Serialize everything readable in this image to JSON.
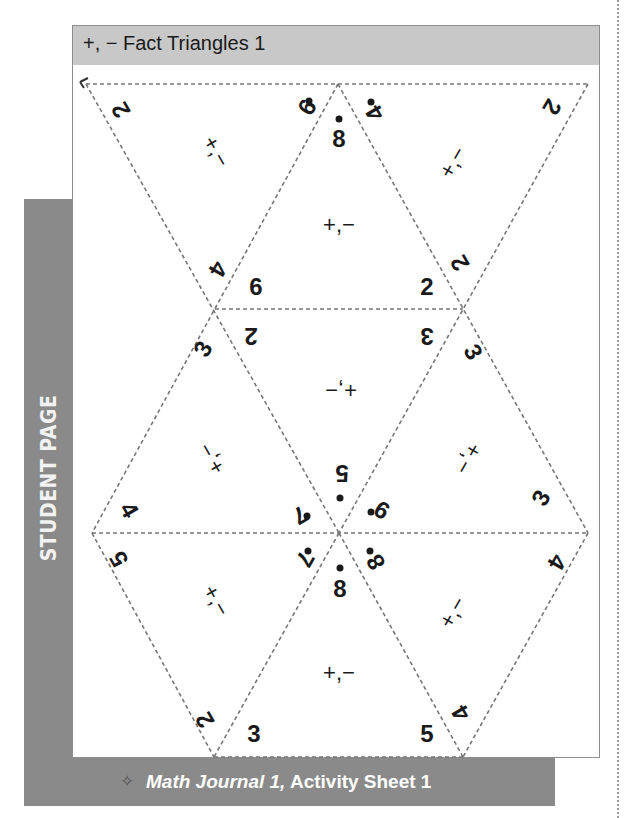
{
  "header": {
    "title": "+, − Fact Triangles 1"
  },
  "side_label": "STUDENT PAGE",
  "footer": {
    "icon": "diamond-star-icon",
    "italic": "Math Journal 1,",
    "rest": " Activity Sheet 1"
  },
  "triangles": [
    {
      "id": "t1",
      "op": "+,−",
      "numbers": [
        "2",
        "9",
        "4"
      ],
      "dot": "9"
    },
    {
      "id": "t2",
      "op": "+,−",
      "numbers": [
        "8",
        "6",
        "2"
      ],
      "dot": "8"
    },
    {
      "id": "t3",
      "op": "+,−",
      "numbers": [
        "4",
        "2",
        "2"
      ],
      "dot": "4"
    },
    {
      "id": "t4",
      "op": "+,−",
      "numbers": [
        "2",
        "3",
        "5"
      ],
      "dot": "5"
    },
    {
      "id": "t5",
      "op": "+,−",
      "numbers": [
        "3",
        "4",
        "7"
      ],
      "dot": "7"
    },
    {
      "id": "t6",
      "op": "+,−",
      "numbers": [
        "3",
        "9",
        "3"
      ],
      "dot": "9"
    },
    {
      "id": "t7",
      "op": "+,−",
      "numbers": [
        "5",
        "7",
        "2"
      ],
      "dot": "7"
    },
    {
      "id": "t8",
      "op": "+,−",
      "numbers": [
        "8",
        "3",
        "5"
      ],
      "dot": "8"
    },
    {
      "id": "t9",
      "op": "+,−",
      "numbers": [
        "8",
        "4",
        "4"
      ],
      "dot": "8"
    }
  ]
}
